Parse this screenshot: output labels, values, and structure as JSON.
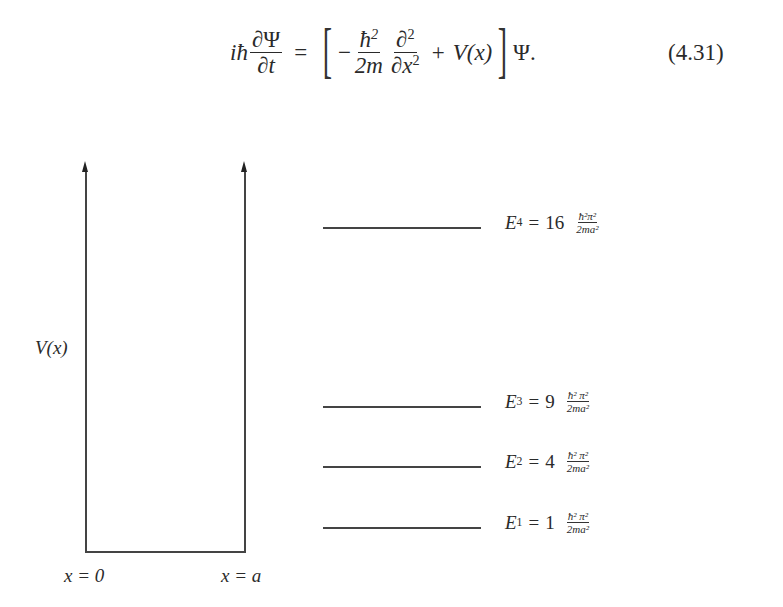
{
  "equation": {
    "lhs_prefix": "iħ",
    "lhs_frac_num": "∂Ψ",
    "lhs_frac_den": "∂t",
    "equals": "=",
    "minus": "−",
    "t1_num": "ħ",
    "t1_num_exp": "2",
    "t1_den": "2m",
    "t2_num": "∂",
    "t2_num_exp": "2",
    "t2_den": "∂x",
    "t2_den_exp": "2",
    "plus": "+",
    "potential": "V(x)",
    "rhs_suffix": "Ψ.",
    "number": "(4.31)"
  },
  "diagram": {
    "y_axis_label": "V(x)",
    "left_wall_label": "x = 0",
    "right_wall_label": "x = a",
    "line_color": "#444444",
    "energy_levels": [
      {
        "name": "E",
        "sub": "4",
        "eq": "=",
        "coef": "16",
        "frac_num": "ħ²π²",
        "frac_den": "2ma²"
      },
      {
        "name": "E",
        "sub": "3",
        "eq": "=",
        "coef": "9",
        "frac_num": "ħ² π²",
        "frac_den": "2ma²"
      },
      {
        "name": "E",
        "sub": "2",
        "eq": "=",
        "coef": "4",
        "frac_num": "ħ² π²",
        "frac_den": "2ma²"
      },
      {
        "name": "E",
        "sub": "1",
        "eq": "=",
        "coef": "1",
        "frac_num": "ħ² π²",
        "frac_den": "2ma²"
      }
    ]
  }
}
